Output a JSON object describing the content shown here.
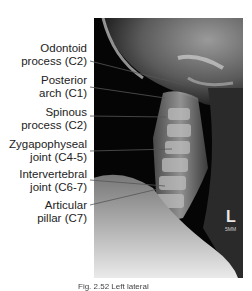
{
  "figure": {
    "labels": [
      {
        "line1": "Odontoid",
        "line2": "process (C2)"
      },
      {
        "line1": "Posterior",
        "line2": "arch (C1)"
      },
      {
        "line1": "Spinous",
        "line2": "process (C2)"
      },
      {
        "line1": "Zygapophyseal",
        "line2": "joint (C4-5)"
      },
      {
        "line1": "Intervertebral",
        "line2": "joint (C6-7)"
      },
      {
        "line1": "Articular",
        "line2": "pillar (C7)"
      }
    ],
    "marker_side": "L",
    "marker_scale": "5MM",
    "caption": "Fig. 2.52 Left lateral"
  }
}
